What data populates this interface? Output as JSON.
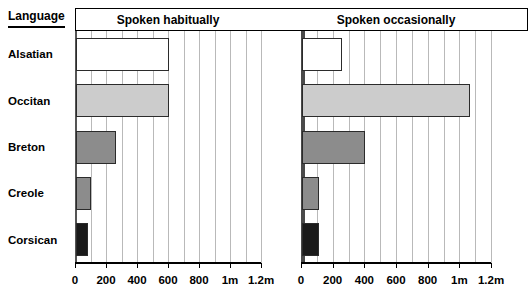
{
  "row_header": {
    "label": "Language"
  },
  "panels": [
    {
      "key": "habitual",
      "title": "Spoken habitually"
    },
    {
      "key": "occasional",
      "title": "Spoken occasionally"
    }
  ],
  "axis": {
    "tick_labels": [
      "0",
      "200",
      "400",
      "600",
      "800",
      "1m",
      "1.2m"
    ],
    "tick_values": [
      0,
      200000,
      400000,
      600000,
      800000,
      1000000,
      1200000
    ],
    "max": 1200000,
    "minor_gridline_step": 100000
  },
  "colors": {
    "bar_white": "#ffffff",
    "bar_light_gray": "#cccccc",
    "bar_mid_gray": "#8c8c8c",
    "bar_dark": "#1a1a1a",
    "bar_outline": "#2b2b2b",
    "gridline": "#b9b9b9",
    "axis": "#4a4a4a",
    "text": "#000000"
  },
  "rows": [
    {
      "language": "Alsatian",
      "fill": "bar_white",
      "habitual": 600000,
      "occasional": 250000
    },
    {
      "language": "Occitan",
      "fill": "bar_light_gray",
      "habitual": 600000,
      "occasional": 1060000
    },
    {
      "language": "Breton",
      "fill": "bar_mid_gray",
      "habitual": 260000,
      "occasional": 400000
    },
    {
      "language": "Creole",
      "fill": "bar_mid_gray",
      "habitual": 95000,
      "occasional": 110000
    },
    {
      "language": "Corsican",
      "fill": "bar_dark",
      "habitual": 80000,
      "occasional": 110000
    }
  ],
  "chart_data": {
    "type": "bar",
    "orientation": "horizontal",
    "title": "",
    "subtitle": "",
    "xlabel": "",
    "ylabel": "Language",
    "categories": [
      "Alsatian",
      "Occitan",
      "Breton",
      "Creole",
      "Corsican"
    ],
    "series": [
      {
        "name": "Spoken habitually",
        "values": [
          600000,
          600000,
          260000,
          95000,
          80000
        ]
      },
      {
        "name": "Spoken occasionally",
        "values": [
          250000,
          1060000,
          400000,
          110000,
          110000
        ]
      }
    ],
    "xlim": [
      0,
      1200000
    ],
    "xtick_labels": [
      "0",
      "200",
      "400",
      "600",
      "800",
      "1m",
      "1.2m"
    ],
    "xtick_values": [
      0,
      200000,
      400000,
      600000,
      800000,
      1000000,
      1200000
    ],
    "grid": true,
    "legend": "none"
  }
}
